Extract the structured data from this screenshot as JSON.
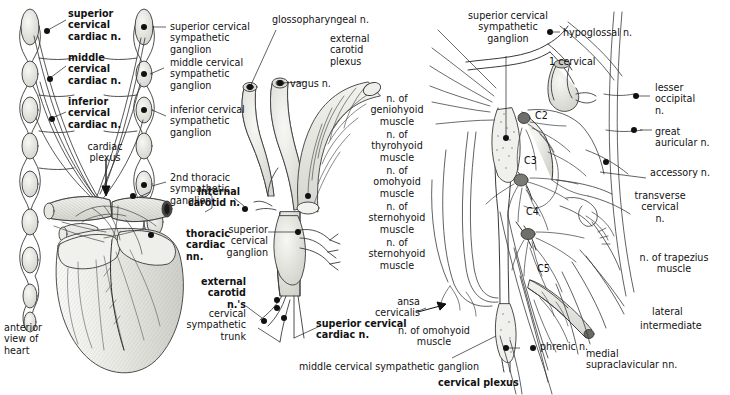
{
  "figure": {
    "kind": "anatomical-illustration",
    "panels": [
      {
        "name": "anterior-view-of-heart",
        "caption": "anterior\nview of\nheart"
      },
      {
        "name": "cervical-sympathetic-trunk-detail",
        "caption": ""
      },
      {
        "name": "cervical-plexus-detail",
        "caption": "cervical plexus"
      }
    ]
  },
  "labels": {
    "superior_cervical_cardiac_n": "superior\ncervical\ncardiac n.",
    "middle_cervical_cardiac_n": "middle\ncervical\ncardiac n.",
    "inferior_cervical_cardiac_n": "inferior\ncervical\ncardiac n.",
    "cardiac_plexus": "cardiac\nplexus",
    "thoracic_cardiac_nn": "thoracic\ncardiac\nnn.",
    "anterior_view_of_heart": "anterior\nview of\nheart",
    "superior_cervical_sympathetic_ganglion_left": "superior cervical\nsympathetic ganglion",
    "middle_cervical_sympathetic_ganglion_left": "middle cervical\nsympathetic\nganglion",
    "inferior_cervical_sympathetic_ganglion": "inferior cervical\nsympathetic\nganglion",
    "second_thoracic_sympathetic_ganglion": "2nd thoracic\nsympathetic\nganglion",
    "internal_carotid_n": "internal\ncarotid n.",
    "external_carotid_ns": "external\ncarotid n.'s",
    "cervical_sympathetic_trunk": "cervical\nsympathetic\ntrunk",
    "superior_cervical_ganglion": "superior\ncervical\nganglion",
    "glossopharyngeal_n": "glossopharyngeal n.",
    "vagus_n": "vagus n.",
    "external_carotid_plexus": "external\ncarotid\nplexus",
    "n_of_geniohyoid_muscle": "n. of\ngeniohyoid\nmuscle",
    "n_of_thyrohyoid_muscle": "n. of\nthyrohyoid\nmuscle",
    "n_of_omohyoid_muscle": "n. of\nomohyoid\nmuscle",
    "n_of_sternohyoid_muscle_1": "n. of\nsternohyoid\nmuscle",
    "n_of_sternohyoid_muscle_2": "n. of\nsternohyoid\nmuscle",
    "ansa_cervicalis": "ansa\ncervicalis",
    "superior_cervical_cardiac_n_mid": "superior cervical\ncardiac n.",
    "n_of_omohyoid_muscle_bottom": "n. of omohyoid\nmuscle",
    "middle_cervical_sympathetic_ganglion_bottom": "middle cervical sympathetic ganglion",
    "superior_cervical_sympathetic_ganglion_right": "superior cervical\nsympathetic\nganglion",
    "hypoglossal_n": "hypoglossal n.",
    "one_cervical": "1 cervical",
    "c2": "C2",
    "c3": "C3",
    "c4": "C4",
    "c5": "C5",
    "lesser_occipital_n": "lesser\noccipital\nn.",
    "great_auricular_n": "great\nauricular n.",
    "accessory_n": "accessory n.",
    "transverse_cervical_n": "transverse\ncervical\nn.",
    "n_of_trapezius_muscle": "n. of trapezius\nmuscle",
    "lateral": "lateral",
    "intermediate": "intermediate",
    "medial_supraclavicular_nn": "medial\nsupraclavicular nn.",
    "phrenic_n": "phrenic n.",
    "cervical_plexus": "cervical plexus"
  },
  "colors": {
    "ink": "#121212",
    "line": "#3a3a3a",
    "fill_light": "#ededea",
    "fill_mid": "#d9d9d4",
    "background": "#ffffff"
  }
}
